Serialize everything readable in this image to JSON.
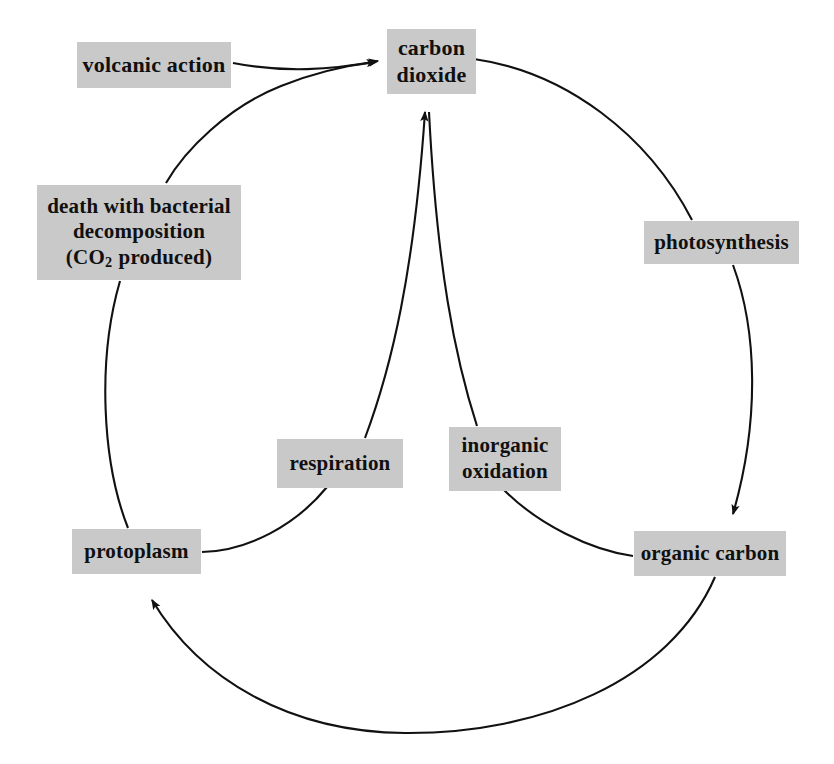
{
  "diagram": {
    "background_color": "#ffffff",
    "box_fill_color": "#c9c9c9",
    "line_color": "#111111",
    "nodes": [
      {
        "id": "carbon-dioxide",
        "lines": [
          "carbon",
          "dioxide"
        ],
        "x": 387,
        "y": 29,
        "w": 89,
        "h": 65
      },
      {
        "id": "volcanic-action",
        "lines": [
          "volcanic action"
        ],
        "x": 77,
        "y": 42,
        "w": 154,
        "h": 46
      },
      {
        "id": "death-decomposition",
        "lines": [
          "death with bacterial",
          "decomposition",
          "(CO2 produced)"
        ],
        "x": 37,
        "y": 185,
        "w": 204,
        "h": 95
      },
      {
        "id": "photosynthesis",
        "lines": [
          "photosynthesis"
        ],
        "x": 644,
        "y": 221,
        "w": 155,
        "h": 43
      },
      {
        "id": "respiration",
        "lines": [
          "respiration"
        ],
        "x": 277,
        "y": 439,
        "w": 126,
        "h": 49
      },
      {
        "id": "inorganic-oxidation",
        "lines": [
          "inorganic",
          "oxidation"
        ],
        "x": 449,
        "y": 427,
        "w": 112,
        "h": 64
      },
      {
        "id": "protoplasm",
        "lines": [
          "protoplasm"
        ],
        "x": 72,
        "y": 529,
        "w": 129,
        "h": 45
      },
      {
        "id": "organic-carbon",
        "lines": [
          "organic carbon"
        ],
        "x": 634,
        "y": 531,
        "w": 152,
        "h": 45
      }
    ],
    "labels": {
      "carbon_dioxide_l1": "carbon",
      "carbon_dioxide_l2": "dioxide",
      "volcanic_action": "volcanic action",
      "death_l1": "death with bacterial",
      "death_l2": "decomposition",
      "death_co2_open": "(CO",
      "death_co2_sub": "2",
      "death_co2_rest": "produced)",
      "photosynthesis": "photosynthesis",
      "respiration": "respiration",
      "inorganic_l1": "inorganic",
      "inorganic_l2": "oxidation",
      "protoplasm": "protoplasm",
      "organic_carbon": "organic carbon"
    },
    "edges": [
      {
        "id": "volcanic-to-co2",
        "from": "volcanic-action",
        "to": "carbon-dioxide",
        "arrow": true
      },
      {
        "id": "death-to-co2",
        "from": "death-decomposition",
        "to": "carbon-dioxide",
        "arrow": true
      },
      {
        "id": "co2-to-photosynthesis",
        "from": "carbon-dioxide",
        "to": "photosynthesis",
        "arrow": false
      },
      {
        "id": "photosynthesis-to-organic-carbon",
        "from": "photosynthesis",
        "to": "organic-carbon",
        "arrow": true
      },
      {
        "id": "organic-carbon-to-protoplasm",
        "from": "organic-carbon",
        "to": "protoplasm",
        "arrow": true
      },
      {
        "id": "protoplasm-to-death",
        "from": "protoplasm",
        "to": "death-decomposition",
        "arrow": false
      },
      {
        "id": "protoplasm-to-respiration",
        "from": "protoplasm",
        "to": "respiration",
        "arrow": false
      },
      {
        "id": "respiration-to-co2",
        "from": "respiration",
        "to": "carbon-dioxide",
        "arrow": true
      },
      {
        "id": "organic-carbon-to-inorganic-oxidation",
        "from": "organic-carbon",
        "to": "inorganic-oxidation",
        "arrow": false
      },
      {
        "id": "inorganic-oxidation-to-co2",
        "from": "inorganic-oxidation",
        "to": "carbon-dioxide",
        "arrow": true
      }
    ]
  }
}
